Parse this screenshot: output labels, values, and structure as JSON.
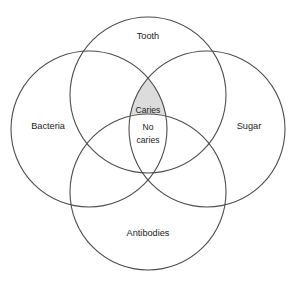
{
  "figure": {
    "background_color": "#ffffff",
    "stroke_color": "#4d4d4d",
    "shade_color": "#dcdcdc",
    "text_color": "#1a1a1a"
  },
  "sets": [
    {
      "key": "tooth",
      "label": "Tooth",
      "position": "top",
      "cx": 148,
      "cy": 95,
      "r": 78,
      "label_x": 148,
      "label_y": 37
    },
    {
      "key": "bacteria",
      "label": "Bacteria",
      "position": "left",
      "cx": 89,
      "cy": 129,
      "r": 78,
      "label_x": 48,
      "label_y": 127
    },
    {
      "key": "sugar",
      "label": "Sugar",
      "position": "right",
      "cx": 207,
      "cy": 129,
      "r": 78,
      "label_x": 249,
      "label_y": 127
    },
    {
      "key": "antibodies",
      "label": "Antibodies",
      "position": "bottom",
      "cx": 148,
      "cy": 192,
      "r": 78,
      "label_x": 148,
      "label_y": 234
    }
  ],
  "regions": [
    {
      "key": "caries",
      "label": "Caries",
      "description": "Tooth and Bacteria and Sugar, without Antibodies",
      "shaded": true,
      "fill": "#dcdcdc",
      "label_x": 148,
      "label_y": 111
    },
    {
      "key": "no-caries",
      "label_line_1": "No",
      "label_line_2": "caries",
      "description": "Tooth and Bacteria and Sugar and Antibodies",
      "shaded": false,
      "fill": "#ffffff",
      "label_x": 148,
      "label_y": 134
    }
  ]
}
